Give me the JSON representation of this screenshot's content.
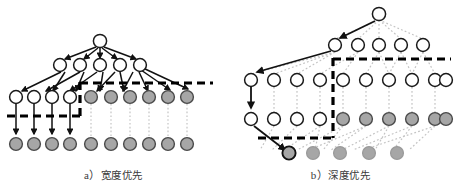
{
  "figure": {
    "panels": [
      {
        "id": "panel-a",
        "caption_label": "a）",
        "caption_text": "宽度优先",
        "caption_full": "a）宽度优先",
        "search_strategy": "breadth-first",
        "levels": [
          {
            "index": 0,
            "node_count": 1,
            "white": 1,
            "gray": 0
          },
          {
            "index": 1,
            "node_count": 5,
            "white": 5,
            "gray": 0
          },
          {
            "index": 2,
            "node_count": 10,
            "white": 4,
            "gray": 6
          },
          {
            "index": 3,
            "node_count": 10,
            "white": 0,
            "gray": 10
          }
        ],
        "frontier_line": "stepped dashed line: upper segment across level-2 gray nodes, vertical drop, lower segment under level-2 white nodes",
        "expanded_edges": "solid arrows",
        "unexpanded_edges": "dotted light arrows"
      },
      {
        "id": "panel-b",
        "caption_label": "b）",
        "caption_text": "深度优先",
        "caption_full": "b）深度优先",
        "search_strategy": "depth-first",
        "levels": [
          {
            "index": 0,
            "node_count": 1,
            "white": 1,
            "gray": 0
          },
          {
            "index": 1,
            "node_count": 5,
            "white": 5,
            "gray": 0
          },
          {
            "index": 2,
            "node_count": 10,
            "white": 10,
            "gray": 0
          },
          {
            "index": 3,
            "node_count": 10,
            "white": 4,
            "gray": 6
          },
          {
            "index": 4,
            "node_count": 5,
            "white": 0,
            "gray": 5
          }
        ],
        "frontier_line": "stepped dashed line: upper-right segment, vertical drop, lower-left segment",
        "expanded_edges": "solid arrows along leftmost branch",
        "unexpanded_edges": "dotted light arrows"
      }
    ]
  },
  "colors": {
    "node_open_fill": "#ffffff",
    "node_closed_fill": "#a6a6a6",
    "node_stroke": "#1a1a1a",
    "solid_edge": "#111111",
    "dotted_edge": "#bdbdbd",
    "frontier_dash": "#000000",
    "background": "#ffffff",
    "caption_text": "#3a3a3a"
  }
}
